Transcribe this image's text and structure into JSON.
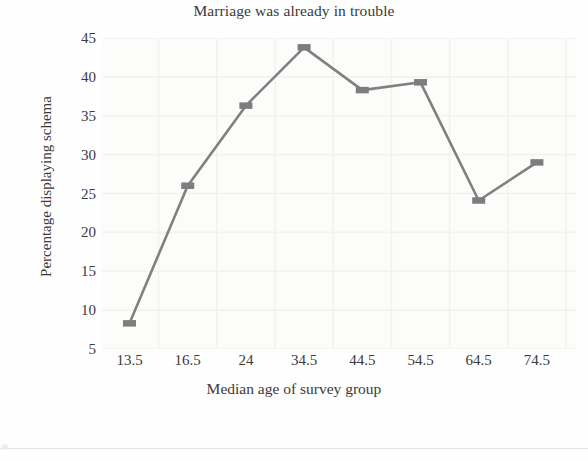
{
  "chart_data": {
    "type": "line",
    "title": "Marriage was already in trouble",
    "xlabel": "Median age of survey group",
    "ylabel": "Percentage displaying schema",
    "categories": [
      "13.5",
      "16.5",
      "24",
      "34.5",
      "44.5",
      "54.5",
      "64.5",
      "74.5"
    ],
    "values": [
      8.3,
      26,
      36.3,
      43.8,
      38.3,
      39.3,
      24.1,
      29
    ],
    "series": [
      {
        "name": "Percentage displaying schema",
        "values": [
          8.3,
          26,
          36.3,
          43.8,
          38.3,
          39.3,
          24.1,
          29
        ]
      }
    ],
    "ylim": [
      5,
      45
    ],
    "ytick_labels": [
      "45",
      "40",
      "35",
      "30",
      "25",
      "20",
      "15",
      "10",
      "5"
    ],
    "ytick_values": [
      45,
      40,
      35,
      30,
      25,
      20,
      15,
      10,
      5
    ],
    "grid": true,
    "grid_color": "#f2f2f0",
    "legend": "none",
    "marker": "square",
    "line_color": "#808080",
    "marker_color": "#7d7d7d",
    "text_color": "#3c3a39",
    "plot_background": "#fcfcfb"
  }
}
